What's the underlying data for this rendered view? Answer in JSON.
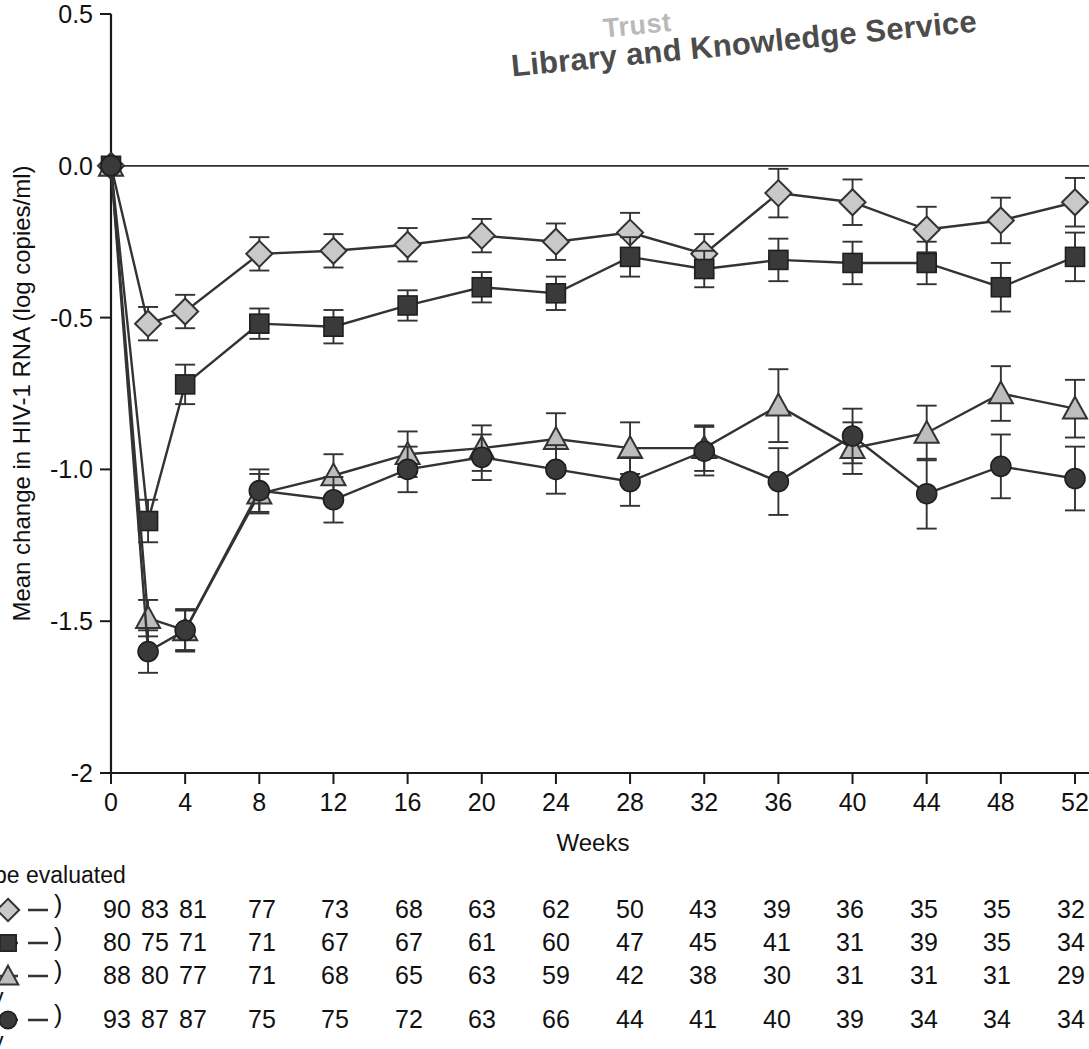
{
  "watermark": {
    "line1": "Trust",
    "line2": "Library and Knowledge Service"
  },
  "axes": {
    "ylabel": "Mean change in HIV-1 RNA (log copies/ml)",
    "xlabel": "Weeks",
    "yticks": [
      "0.5",
      "0.0",
      "-0.5",
      "-1.0",
      "-1.5",
      "-2"
    ],
    "xticks": [
      "0",
      "4",
      "8",
      "12",
      "16",
      "20",
      "24",
      "28",
      "32",
      "36",
      "40",
      "44",
      "48",
      "52"
    ]
  },
  "footer": {
    "note": "be evaluated",
    "legend_paren": ")",
    "sub_label_1": "y",
    "sub_label_2": "y",
    "rows": [
      {
        "marker": "diamond",
        "values": [
          "90",
          "83",
          "81",
          "77",
          "73",
          "68",
          "63",
          "62",
          "50",
          "43",
          "39",
          "36",
          "35",
          "35",
          "32"
        ]
      },
      {
        "marker": "square",
        "values": [
          "80",
          "75",
          "71",
          "71",
          "67",
          "67",
          "61",
          "60",
          "47",
          "45",
          "41",
          "31",
          "39",
          "35",
          "34"
        ]
      },
      {
        "marker": "triangle",
        "values": [
          "88",
          "80",
          "77",
          "71",
          "68",
          "65",
          "63",
          "59",
          "42",
          "38",
          "30",
          "31",
          "31",
          "31",
          "29"
        ]
      },
      {
        "marker": "circle",
        "values": [
          "93",
          "87",
          "87",
          "75",
          "75",
          "72",
          "63",
          "66",
          "44",
          "41",
          "40",
          "39",
          "34",
          "34",
          "34"
        ]
      }
    ]
  },
  "chart_data": {
    "type": "line",
    "title": "",
    "xlabel": "Weeks",
    "ylabel": "Mean change in HIV-1 RNA (log copies/ml)",
    "xlim": [
      0,
      52
    ],
    "ylim": [
      -2,
      0.5
    ],
    "grid": false,
    "legend_position": "none",
    "x": [
      0,
      2,
      4,
      8,
      12,
      16,
      20,
      24,
      28,
      32,
      36,
      40,
      44,
      48,
      52
    ],
    "series": [
      {
        "name": "diamond-series",
        "marker": "diamond",
        "marker_fill": "#c9c9c9",
        "marker_stroke": "#333333",
        "values": [
          0.0,
          -0.52,
          -0.48,
          -0.29,
          -0.28,
          -0.26,
          -0.23,
          -0.25,
          -0.22,
          -0.29,
          -0.09,
          -0.12,
          -0.21,
          -0.18,
          -0.12
        ],
        "errors": [
          0.0,
          0.055,
          0.055,
          0.055,
          0.055,
          0.055,
          0.055,
          0.06,
          0.065,
          0.065,
          0.08,
          0.075,
          0.075,
          0.075,
          0.08
        ]
      },
      {
        "name": "square-series",
        "marker": "square",
        "marker_fill": "#3a3a3a",
        "marker_stroke": "#1f1f1f",
        "values": [
          0.0,
          -1.17,
          -0.72,
          -0.52,
          -0.53,
          -0.46,
          -0.4,
          -0.42,
          -0.3,
          -0.34,
          -0.31,
          -0.32,
          -0.32,
          -0.4,
          -0.3
        ],
        "errors": [
          0.0,
          0.07,
          0.065,
          0.05,
          0.055,
          0.05,
          0.05,
          0.055,
          0.065,
          0.06,
          0.07,
          0.07,
          0.07,
          0.08,
          0.08
        ]
      },
      {
        "name": "triangle-series",
        "marker": "triangle",
        "marker_fill": "#bdbdbd",
        "marker_stroke": "#333333",
        "values": [
          0.0,
          -1.49,
          -1.53,
          -1.08,
          -1.02,
          -0.95,
          -0.93,
          -0.9,
          -0.93,
          -0.93,
          -0.79,
          -0.93,
          -0.88,
          -0.75,
          -0.8
        ],
        "errors": [
          0.0,
          0.06,
          0.065,
          0.065,
          0.07,
          0.075,
          0.075,
          0.085,
          0.085,
          0.075,
          0.12,
          0.085,
          0.09,
          0.09,
          0.095
        ]
      },
      {
        "name": "circle-series",
        "marker": "circle",
        "marker_fill": "#3a3a3a",
        "marker_stroke": "#1f1f1f",
        "values": [
          0.0,
          -1.6,
          -1.53,
          -1.07,
          -1.1,
          -1.0,
          -0.96,
          -1.0,
          -1.04,
          -0.94,
          -1.04,
          -0.89,
          -1.08,
          -0.99,
          -1.03
        ],
        "errors": [
          0.0,
          0.07,
          0.07,
          0.07,
          0.075,
          0.075,
          0.075,
          0.08,
          0.08,
          0.08,
          0.11,
          0.09,
          0.115,
          0.105,
          0.105
        ]
      }
    ]
  }
}
